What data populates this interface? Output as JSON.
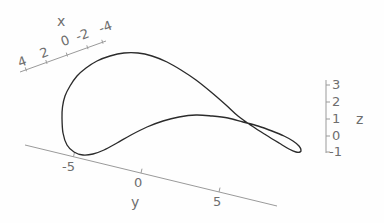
{
  "figure": {
    "title": "",
    "background_color": "#fefefe",
    "curve_color": "#2b2b2b",
    "axis_color": "#9a9a9a",
    "label_color": "#6e6e6e"
  },
  "chart_data": {
    "type": "line",
    "title": "",
    "subtitle": "",
    "projection": "3d-parametric-space-curve",
    "xlabel": "x",
    "ylabel": "y",
    "zlabel": "z",
    "xlim": [
      -4,
      4
    ],
    "ylim": [
      -7,
      7
    ],
    "zlim": [
      -1,
      3
    ],
    "grid": false,
    "legend": null,
    "annotations": [],
    "axes": {
      "x": {
        "label": "x",
        "ticks": [
          4,
          2,
          0,
          -2,
          -4
        ],
        "tick_labels": [
          "4",
          "2",
          "0",
          "-2",
          "-4"
        ],
        "direction": "up-right"
      },
      "y": {
        "label": "y",
        "ticks": [
          -5,
          0,
          5
        ],
        "tick_labels": [
          "-5",
          "0",
          "5"
        ],
        "direction": "down-right"
      },
      "z": {
        "label": "z",
        "ticks": [
          3,
          2,
          1,
          0,
          -1
        ],
        "tick_labels": [
          "3",
          "2",
          "1",
          "0",
          "-1"
        ],
        "direction": "vertical"
      }
    },
    "series": [
      {
        "name": "curve",
        "closed": true,
        "self_intersecting": true,
        "points_px": [
          [
            62,
            118
          ],
          [
            62.5,
            107
          ],
          [
            65,
            96
          ],
          [
            70,
            86
          ],
          [
            77,
            76
          ],
          [
            86,
            68
          ],
          [
            97,
            61
          ],
          [
            110,
            56
          ],
          [
            124,
            53
          ],
          [
            138,
            53
          ],
          [
            152,
            56
          ],
          [
            167,
            62
          ],
          [
            181,
            70
          ],
          [
            196,
            80
          ],
          [
            211,
            92
          ],
          [
            226,
            105
          ],
          [
            238,
            116
          ],
          [
            252,
            126
          ],
          [
            266,
            135
          ],
          [
            279,
            143
          ],
          [
            289,
            149
          ],
          [
            296,
            152
          ],
          [
            300,
            152
          ],
          [
            301,
            150
          ],
          [
            299,
            146
          ],
          [
            293,
            141
          ],
          [
            284,
            136
          ],
          [
            272,
            131
          ],
          [
            258,
            126
          ],
          [
            243,
            122
          ],
          [
            228,
            118
          ],
          [
            212,
            116
          ],
          [
            196,
            115
          ],
          [
            179,
            117
          ],
          [
            163,
            121
          ],
          [
            147,
            127
          ],
          [
            131,
            135
          ],
          [
            117,
            143
          ],
          [
            104,
            150
          ],
          [
            93,
            154
          ],
          [
            83,
            155
          ],
          [
            74,
            152
          ],
          [
            67,
            145
          ],
          [
            63,
            133
          ],
          [
            62,
            118
          ]
        ]
      }
    ]
  },
  "x_axis": {
    "label": "x",
    "ticks": [
      {
        "text": "4",
        "x": 16,
        "y": 57
      },
      {
        "text": "2",
        "x": 38,
        "y": 50
      },
      {
        "text": "0",
        "x": 60,
        "y": 34
      },
      {
        "text": "-2",
        "x": 76,
        "y": 31
      },
      {
        "text": "-4",
        "x": 97,
        "y": 26
      }
    ],
    "title_pos": {
      "x": 56,
      "y": 16
    }
  },
  "y_axis": {
    "label": "y",
    "ticks": [
      {
        "text": "-5",
        "x": 62,
        "y": 160
      },
      {
        "text": "0",
        "x": 131,
        "y": 177
      },
      {
        "text": "5",
        "x": 212,
        "y": 193
      }
    ],
    "title_pos": {
      "x": 131,
      "y": 196
    }
  },
  "z_axis": {
    "label": "z",
    "ticks": [
      {
        "text": "3",
        "x": 331,
        "y": 79
      },
      {
        "text": "2",
        "x": 331,
        "y": 96
      },
      {
        "text": "1",
        "x": 331,
        "y": 113
      },
      {
        "text": "0",
        "x": 331,
        "y": 130
      },
      {
        "text": "-1",
        "x": 328,
        "y": 146
      }
    ],
    "title_pos": {
      "x": 355,
      "y": 113
    }
  }
}
